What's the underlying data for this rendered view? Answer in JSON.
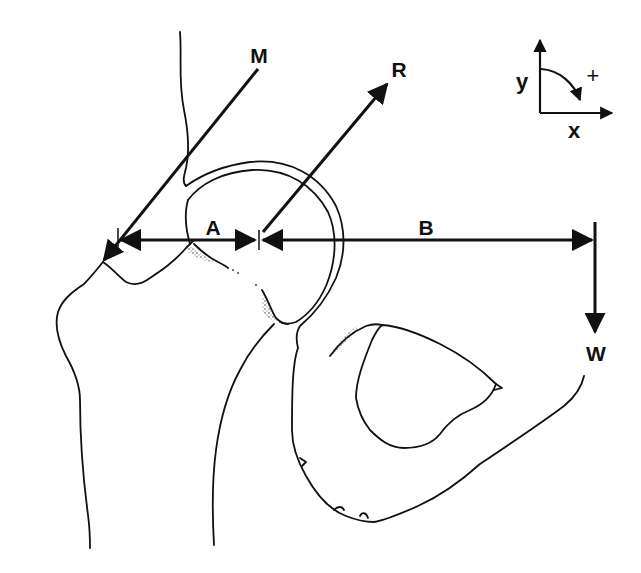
{
  "diagram": {
    "forces": [
      {
        "id": "M",
        "label": "M",
        "direction": "down-left, toward greater trochanter"
      },
      {
        "id": "R",
        "label": "R",
        "direction": "up-right, from femoral head center"
      },
      {
        "id": "W",
        "label": "W",
        "direction": "vertical down"
      }
    ],
    "moment_arms": [
      {
        "id": "A",
        "label": "A",
        "from": "M line of action",
        "to": "R / joint center"
      },
      {
        "id": "B",
        "label": "B",
        "from": "R / joint center",
        "to": "W line of action"
      }
    ],
    "coordinate_system": {
      "x_label": "x",
      "y_label": "y",
      "rotation_sign": "+",
      "rotation_direction": "clockwise"
    },
    "colors": {
      "ink": "#111111",
      "background": "#ffffff"
    }
  }
}
